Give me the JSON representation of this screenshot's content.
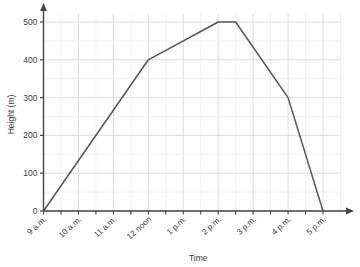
{
  "chart_data": {
    "type": "line",
    "title": "",
    "xlabel": "Time",
    "ylabel": "Height (m)",
    "x_tick_labels": [
      "9 a.m.",
      "10 a.m.",
      "11 a.m.",
      "12 noon",
      "1 p.m.",
      "2 p.m.",
      "3 p.m.",
      "4 p.m.",
      "5 p.m."
    ],
    "x_tick_hours": [
      9,
      10,
      11,
      12,
      13,
      14,
      15,
      16,
      17
    ],
    "y_tick_labels": [
      "0",
      "100",
      "200",
      "300",
      "400",
      "500"
    ],
    "y_tick_values": [
      0,
      100,
      200,
      300,
      400,
      500
    ],
    "xlim": [
      9,
      17
    ],
    "ylim": [
      0,
      520
    ],
    "grid": true,
    "grid_minor_x_step_hours": 0.5,
    "grid_minor_y_step": 50,
    "legend": "none",
    "series": [
      {
        "name": "Height",
        "color": "#555555",
        "points": [
          {
            "x": 9,
            "y": 0,
            "label": "9 a.m."
          },
          {
            "x": 12,
            "y": 400,
            "label": "12 noon"
          },
          {
            "x": 14,
            "y": 500,
            "label": "2 p.m."
          },
          {
            "x": 14.5,
            "y": 500,
            "label": "2:30 p.m."
          },
          {
            "x": 16,
            "y": 300,
            "label": "4 p.m."
          },
          {
            "x": 17,
            "y": 0,
            "label": "5 p.m."
          }
        ]
      }
    ],
    "colors": {
      "line": "#555555",
      "axis": "#444444",
      "grid_major": "#d8dde6",
      "grid_minor": "#eef1f5",
      "text": "#3a3a3a",
      "background": "#ffffff"
    }
  }
}
